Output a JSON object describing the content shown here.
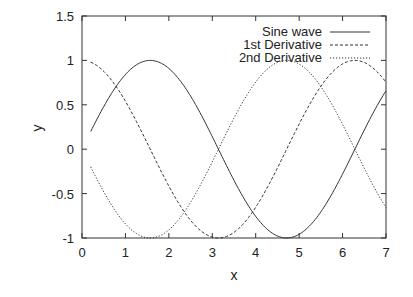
{
  "chart_data": {
    "type": "line",
    "title": "",
    "xlabel": "x",
    "ylabel": "y",
    "xlim": [
      0,
      7
    ],
    "ylim": [
      -1,
      1.5
    ],
    "xticks": [
      0,
      1,
      2,
      3,
      4,
      5,
      6,
      7
    ],
    "yticks": [
      -1,
      -0.5,
      0,
      0.5,
      1,
      1.5
    ],
    "xtick_labels": [
      "0",
      "1",
      "2",
      "3",
      "4",
      "5",
      "6",
      "7"
    ],
    "ytick_labels": [
      "-1",
      "-0.5",
      "0",
      "0.5",
      "1",
      "1.5"
    ],
    "grid": false,
    "legend_position": "top-right",
    "x_range": [
      0.2,
      7
    ],
    "series": [
      {
        "name": "Sine wave",
        "function": "sin(x)",
        "style": "solid",
        "x": [
          0.2,
          0.5,
          1,
          1.5708,
          2,
          2.5,
          3,
          3.1416,
          3.5,
          4,
          4.5,
          4.7124,
          5,
          5.5,
          6,
          6.5,
          7
        ],
        "values": [
          0.199,
          0.479,
          0.841,
          1.0,
          0.909,
          0.598,
          0.141,
          0.0,
          -0.351,
          -0.757,
          -0.978,
          -1.0,
          -0.959,
          -0.706,
          -0.279,
          0.215,
          0.657
        ]
      },
      {
        "name": "1st Derivative",
        "function": "cos(x)",
        "style": "dashed",
        "x": [
          0.2,
          0.5,
          1,
          1.5708,
          2,
          2.5,
          3,
          3.1416,
          3.5,
          4,
          4.5,
          4.7124,
          5,
          5.5,
          6,
          6.2832,
          6.5,
          7
        ],
        "values": [
          0.98,
          0.878,
          0.54,
          0.0,
          -0.416,
          -0.801,
          -0.99,
          -1.0,
          -0.936,
          -0.654,
          -0.211,
          0.0,
          0.284,
          0.709,
          0.96,
          1.0,
          0.977,
          0.754
        ]
      },
      {
        "name": "2nd Derivative",
        "function": "-sin(x)",
        "style": "dotted",
        "x": [
          0.2,
          0.5,
          1,
          1.5708,
          2,
          2.5,
          3,
          3.1416,
          3.5,
          4,
          4.5,
          4.7124,
          5,
          5.5,
          6,
          6.5,
          7
        ],
        "values": [
          -0.199,
          -0.479,
          -0.841,
          -1.0,
          -0.909,
          -0.598,
          -0.141,
          0.0,
          0.351,
          0.757,
          0.978,
          1.0,
          0.959,
          0.706,
          0.279,
          -0.215,
          -0.657
        ]
      }
    ],
    "colors": {
      "axis": "#333333",
      "line": "#333333",
      "background": "#ffffff"
    }
  }
}
